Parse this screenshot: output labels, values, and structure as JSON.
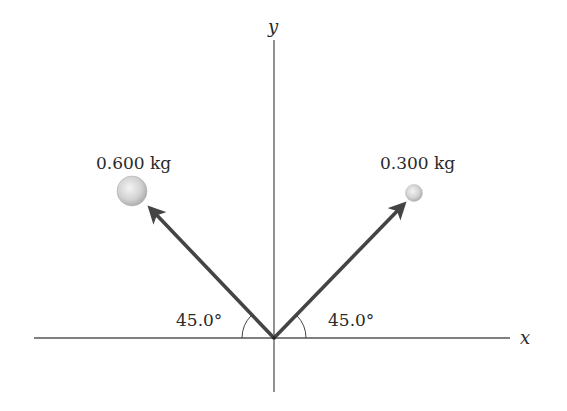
{
  "diagram": {
    "type": "vector-diagram",
    "axes": {
      "x_label": "x",
      "y_label": "y",
      "origin": [
        274,
        338
      ],
      "x_range_px": [
        34,
        510
      ],
      "y_range_px": [
        38,
        392
      ]
    },
    "objects": [
      {
        "id": "left-mass",
        "mass_label": "0.600 kg",
        "angle_label": "45.0°",
        "direction": "up-left",
        "angle_deg_from_negative_x": 45.0,
        "ball_radius": 15
      },
      {
        "id": "right-mass",
        "mass_label": "0.300 kg",
        "angle_label": "45.0°",
        "direction": "up-right",
        "angle_deg_from_positive_x": 45.0,
        "ball_radius": 8
      }
    ],
    "colors": {
      "axis": "#555555",
      "arrow": "#444444",
      "ball_light": "#f2f2f2",
      "ball_dark": "#a8a8a8",
      "text": "#2a2a2a"
    }
  }
}
